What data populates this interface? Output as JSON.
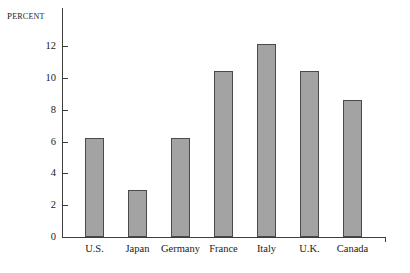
{
  "chart_data": {
    "type": "bar",
    "title": "",
    "subtitle": "",
    "xlabel": "",
    "ylabel": "Percent",
    "categories": [
      "U.S.",
      "Japan",
      "Germany",
      "France",
      "Italy",
      "U.K.",
      "Canada"
    ],
    "values": [
      6.2,
      2.95,
      6.2,
      10.45,
      12.15,
      10.45,
      8.6
    ],
    "ylim": [
      0,
      12.9
    ],
    "yticks": [
      0,
      2,
      4,
      6,
      8,
      10,
      12
    ],
    "ytick_labels": [
      "0",
      "2",
      "4",
      "6",
      "8",
      "10",
      "12"
    ],
    "grid": false,
    "legend": null,
    "legend_position": "none",
    "bar_fill_color": "#a3a3a3",
    "bar_edge_color": "#4a4a4a",
    "axis_color": "#3d3d3d",
    "background_color": "#ffffff"
  }
}
